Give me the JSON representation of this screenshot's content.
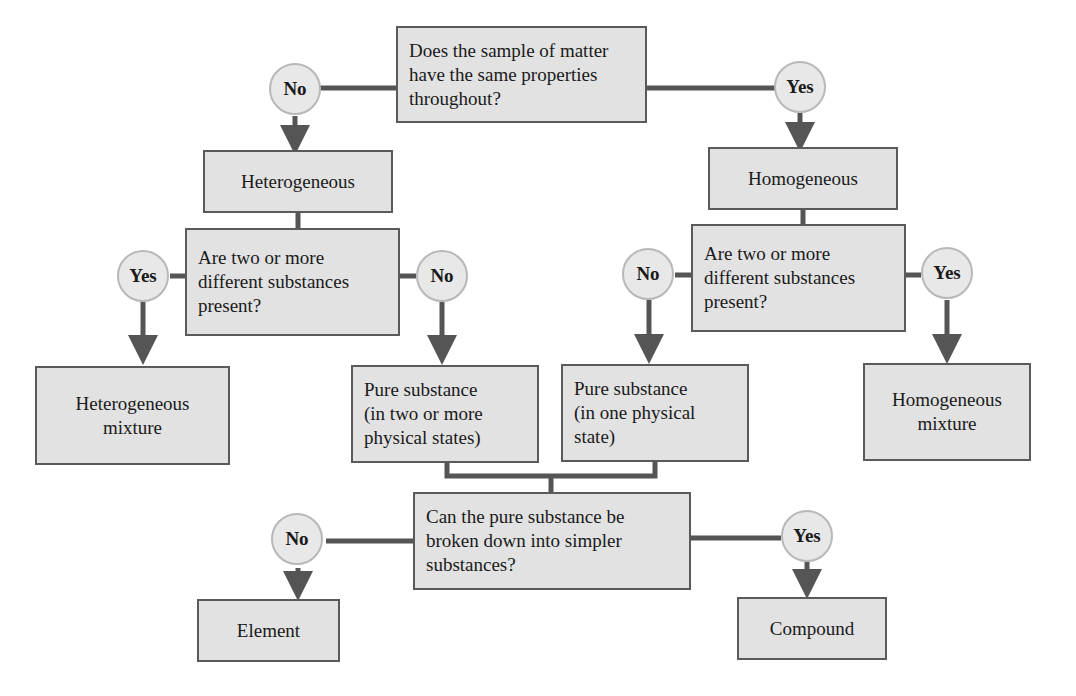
{
  "colors": {
    "box_fill": "#e2e2e2",
    "box_border": "#5a5a5a",
    "connector": "#555555",
    "circle_fill": "#e8e8e8",
    "circle_border": "#b8b8b8"
  },
  "nodes": {
    "q1": "Does the sample of matter\nhave the same properties\nthroughout?",
    "heterogeneous": "Heterogeneous",
    "homogeneous": "Homogeneous",
    "q2_left": "Are two or more\ndifferent substances\npresent?",
    "q2_right": "Are two or more\ndifferent substances\npresent?",
    "het_mixture": "Heterogeneous\nmixture",
    "pure_multi": "Pure substance\n(in two or more\nphysical states)",
    "pure_one": "Pure substance\n(in one physical\nstate)",
    "hom_mixture": "Homogeneous\nmixture",
    "q3": "Can the pure substance be\nbroken down into simpler\nsubstances?",
    "element": "Element",
    "compound": "Compound"
  },
  "answers": {
    "q1_no": "No",
    "q1_yes": "Yes",
    "q2l_yes": "Yes",
    "q2l_no": "No",
    "q2r_no": "No",
    "q2r_yes": "Yes",
    "q3_no": "No",
    "q3_yes": "Yes"
  }
}
